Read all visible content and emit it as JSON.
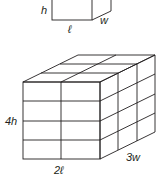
{
  "small_box": {
    "labels": {
      "height": "h",
      "length": "ℓ",
      "width": "w"
    }
  },
  "large_box": {
    "labels": {
      "height": "4h",
      "length": "2ℓ",
      "width": "3w"
    },
    "grid": {
      "length_units": 2,
      "height_units": 4,
      "width_units": 3
    }
  },
  "colors": {
    "line": "#231f20",
    "background": "#ffffff"
  }
}
